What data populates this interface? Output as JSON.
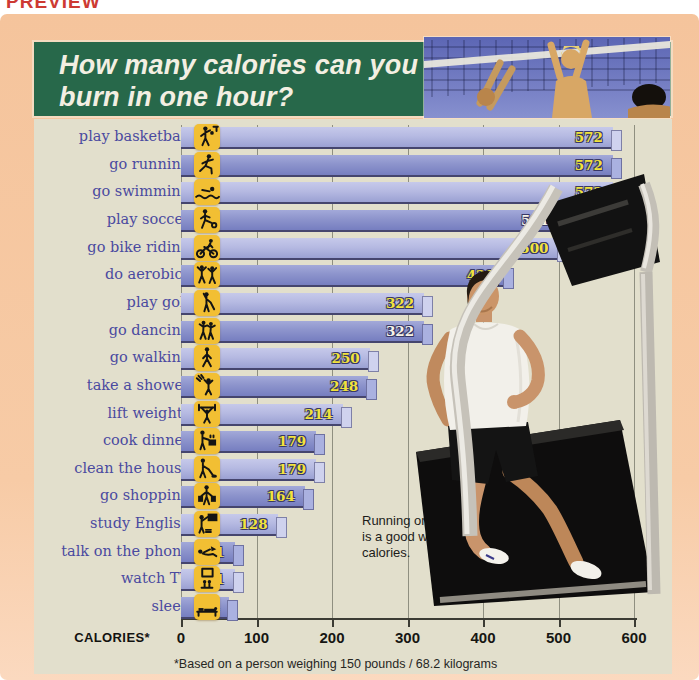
{
  "preview_label": "PREVIEW",
  "header": {
    "title_line1": "How many calories can you",
    "title_line2": "burn in one hour?"
  },
  "annotation": {
    "text": "Running on a treadmill is a good way to burn calories."
  },
  "chart_data": {
    "type": "bar",
    "orientation": "horizontal",
    "title": "How many calories can you burn in one hour?",
    "xlabel": "CALORIES*",
    "x_ticks": [
      0,
      100,
      200,
      300,
      400,
      500,
      600
    ],
    "xlim": [
      0,
      600
    ],
    "grid": true,
    "footnote": "*Based on a person weighing 150 pounds / 68.2 kilograms",
    "rows": [
      {
        "label": "play basketball",
        "value": 572,
        "icon": "basketball-icon",
        "value_color": "yellow"
      },
      {
        "label": "go running",
        "value": 572,
        "icon": "running-icon",
        "value_color": "yellow"
      },
      {
        "label": "go swimming",
        "value": 572,
        "icon": "swimming-icon",
        "value_color": "yellow"
      },
      {
        "label": "play soccer",
        "value": 501,
        "icon": "soccer-icon",
        "value_color": "white"
      },
      {
        "label": "go bike riding",
        "value": 500,
        "icon": "bike-icon",
        "value_color": "yellow"
      },
      {
        "label": "do aerobics",
        "value": 429,
        "icon": "aerobics-icon",
        "value_color": "yellow"
      },
      {
        "label": "play golf",
        "value": 322,
        "icon": "golf-icon",
        "value_color": "yellow"
      },
      {
        "label": "go dancing",
        "value": 322,
        "icon": "dancing-icon",
        "value_color": "white"
      },
      {
        "label": "go walking",
        "value": 250,
        "icon": "walking-icon",
        "value_color": "yellow"
      },
      {
        "label": "take a shower",
        "value": 248,
        "icon": "shower-icon",
        "value_color": "yellow"
      },
      {
        "label": "lift weights",
        "value": 214,
        "icon": "weights-icon",
        "value_color": "yellow"
      },
      {
        "label": "cook dinner",
        "value": 179,
        "icon": "cooking-icon",
        "value_color": "yellow"
      },
      {
        "label": "clean the house",
        "value": 179,
        "icon": "cleaning-icon",
        "value_color": "yellow"
      },
      {
        "label": "go shopping",
        "value": 164,
        "icon": "shopping-icon",
        "value_color": "yellow"
      },
      {
        "label": "study English",
        "value": 128,
        "icon": "study-icon",
        "value_color": "yellow"
      },
      {
        "label": "talk on the phone",
        "value": 71,
        "icon": "phone-icon",
        "value_color": "yellow"
      },
      {
        "label": "watch TV",
        "value": 71,
        "icon": "tv-icon",
        "value_color": "yellow"
      },
      {
        "label": "sleep",
        "value": 64,
        "icon": "sleep-icon",
        "value_color": "yellow"
      }
    ]
  },
  "colors": {
    "panel_bg": "#f6c8a1",
    "header_green": "#27684a",
    "header_text": "#f3efe2",
    "chart_bg": "#e2dfcc",
    "bar_light": "#b6bae2",
    "bar_dark": "#8d94cc",
    "bar_shadow": "#45456e",
    "value_yellow": "#f2e33c",
    "value_white": "#f6f3e7",
    "label_purple": "#4a4aa0",
    "icon_yellow": "#f2bf33",
    "preview_red": "#cd3a33",
    "grid_line": "#8f8f80"
  }
}
